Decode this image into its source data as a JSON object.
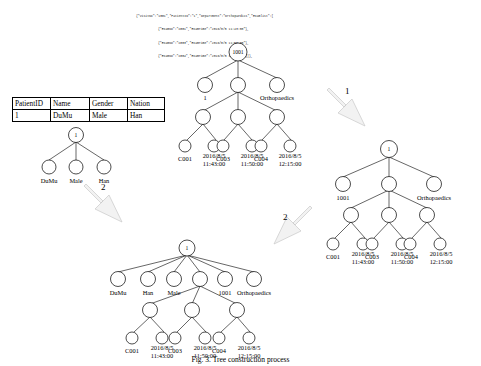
{
  "document": {
    "caption": "Fig. 3. Tree construction process"
  },
  "json_source": {
    "lines": [
      "{\"VisitNo\":\"1001\",\"PatientID\":\"1\",\"Department\":\"Orthopaedics\",\"Examlist\":[",
      "{\"ExamNo\":\"C001\",\"ExamTime\":\"2016/8/5 11:43:00\"},",
      "{\"ExamNo\":\"C003\",\"ExamTime\":\"2016/8/5 11:50:00\"},",
      "{\"ExamNo\":\"C004\",\"ExamTime\":\"2016/8/5 12:15:00\"}]},"
    ]
  },
  "patient_table": {
    "headers": [
      "PatientID",
      "Name",
      "Gender",
      "Nation"
    ],
    "rows": [
      [
        "1",
        "DuMu",
        "Male",
        "Han"
      ]
    ]
  },
  "arrows": [
    {
      "label": "1",
      "direction": "down-right"
    },
    {
      "label": "2",
      "direction": "down-right"
    },
    {
      "label": "2",
      "direction": "down-left"
    }
  ],
  "trees": {
    "json_tree": {
      "name": "json-tree",
      "root": "1001",
      "level1": [
        "1",
        "",
        "Orthopaedics"
      ],
      "leaves": [
        {
          "exam_no": "C001",
          "date": "2016/8/5",
          "time": "11:43:00"
        },
        {
          "exam_no": "C003",
          "date": "2016/8/5",
          "time": "11:50:00"
        },
        {
          "exam_no": "C004",
          "date": "2016/8/5",
          "time": "12:15:00"
        }
      ]
    },
    "table_tree": {
      "name": "table-tree",
      "root": "1",
      "children": [
        "DuMu",
        "Male",
        "Han"
      ]
    },
    "merged_right_tree": {
      "name": "merged-right-tree",
      "root": "1",
      "level1": [
        "1001",
        "",
        "Orthopaedics"
      ],
      "leaves": [
        {
          "exam_no": "C001",
          "date": "2016/8/5",
          "time": "11:43:00"
        },
        {
          "exam_no": "C003",
          "date": "2016/8/5",
          "time": "11:50:00"
        },
        {
          "exam_no": "C004",
          "date": "2016/8/5",
          "time": "12:15:00"
        }
      ]
    },
    "final_tree": {
      "name": "final-tree",
      "root": "1",
      "level1": [
        "DuMu",
        "Han",
        "Male",
        "",
        "1001",
        "Orthopaedics"
      ],
      "leaves": [
        {
          "exam_no": "C001",
          "date": "2016/8/5",
          "time": "11:43:00"
        },
        {
          "exam_no": "C003",
          "date": "2016/8/5",
          "time": "11:50:00"
        },
        {
          "exam_no": "C004",
          "date": "2016/8/5",
          "time": "12:15:00"
        }
      ]
    }
  }
}
